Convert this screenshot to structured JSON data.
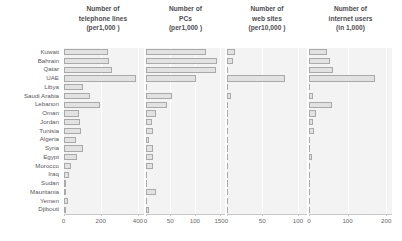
{
  "figure": {
    "background": "#ffffff",
    "bar_fill": "#e2e2e2",
    "bar_stroke": "#a9a9a9",
    "panel_bg": "#f3f3f3",
    "grid_color": "#ffffff",
    "text_color": "#58585a"
  },
  "countries": [
    "Kuwait",
    "Bahrain",
    "Qatar",
    "UAE",
    "Libya",
    "Saudi Arabia",
    "Lebanon",
    "Oman",
    "Jordan",
    "Tunisia",
    "Algeria",
    "Syria",
    "Egypt",
    "Morocco",
    "Iraq",
    "Sudan",
    "Mauritania",
    "Yemen",
    "Djibouti"
  ],
  "panels": [
    {
      "title_lines": [
        "Number of",
        "telephone lines",
        "(per1,000 )"
      ],
      "ticks": [
        0,
        200,
        400
      ],
      "xmax": 430
    },
    {
      "title_lines": [
        "Number of",
        "PCs",
        "(per1,000 )"
      ],
      "ticks": [
        0,
        50,
        100,
        150
      ],
      "xmax": 160
    },
    {
      "title_lines": [
        "Number of",
        "web sites",
        "(per10,000 )"
      ],
      "ticks": [
        0,
        50,
        100
      ],
      "xmax": 112
    },
    {
      "title_lines": [
        "Number of",
        "internet users",
        "(in 1,000)"
      ],
      "ticks": [
        0,
        100,
        200
      ],
      "xmax": 215
    }
  ],
  "chart_data": {
    "type": "bar",
    "orientation": "horizontal",
    "categories": [
      "Kuwait",
      "Bahrain",
      "Qatar",
      "UAE",
      "Libya",
      "Saudi Arabia",
      "Lebanon",
      "Oman",
      "Jordan",
      "Tunisia",
      "Algeria",
      "Syria",
      "Egypt",
      "Morocco",
      "Iraq",
      "Sudan",
      "Mauritania",
      "Yemen",
      "Djibouti"
    ],
    "ylabel": "Country",
    "grid": true,
    "legend": "none",
    "series": [
      {
        "name": "Number of telephone lines (per1,000 )",
        "xlabel": "per 1,000 inhabitants",
        "xlim": [
          0,
          430
        ],
        "ticks": [
          0,
          200,
          400
        ],
        "values": [
          240,
          245,
          260,
          390,
          105,
          145,
          195,
          85,
          88,
          95,
          65,
          105,
          75,
          42,
          30,
          14,
          11,
          22,
          14
        ]
      },
      {
        "name": "Number of PCs (per1,000 )",
        "xlabel": "per 1,000 inhabitants",
        "xlim": [
          0,
          160
        ],
        "ticks": [
          0,
          50,
          100,
          150
        ],
        "values": [
          123,
          145,
          142,
          102,
          0,
          53,
          43,
          21,
          14,
          15,
          7,
          15,
          15,
          15,
          2,
          2,
          22,
          2,
          7
        ]
      },
      {
        "name": "Number of web sites (per10,000 )",
        "xlabel": "per 10,000 inhabitants",
        "xlim": [
          0,
          112
        ],
        "ticks": [
          0,
          50,
          100
        ],
        "values": [
          12,
          9,
          1.5,
          82,
          1.5,
          6,
          1.5,
          1.5,
          0,
          0,
          0,
          0,
          1.5,
          0,
          0,
          0,
          0,
          0,
          0
        ]
      },
      {
        "name": "Number of internet users (in 1,000)",
        "xlabel": "thousands of users",
        "xlim": [
          0,
          215
        ],
        "ticks": [
          0,
          100,
          200
        ],
        "values": [
          47,
          55,
          62,
          170,
          2,
          11,
          60,
          18,
          11,
          12,
          0,
          3,
          8,
          3,
          0,
          0,
          0,
          2,
          0
        ]
      }
    ]
  }
}
